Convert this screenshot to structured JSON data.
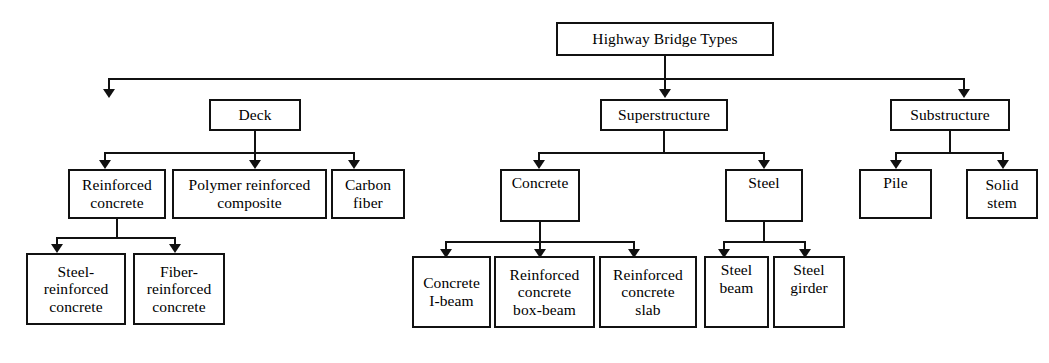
{
  "diagram": {
    "title_node": "Highway Bridge Types",
    "type": "hierarchy-tree",
    "orientation": "top-down",
    "line_color": "#111111",
    "box_fill": "#ffffff",
    "levels": [
      {
        "level": 0,
        "nodes": [
          {
            "id": "root",
            "label": "Highway Bridge Types"
          }
        ]
      },
      {
        "level": 1,
        "nodes": [
          {
            "id": "deck",
            "label": "Deck",
            "parent": "root"
          },
          {
            "id": "superstructure",
            "label": "Superstructure",
            "parent": "root"
          },
          {
            "id": "substructure",
            "label": "Substructure",
            "parent": "root"
          }
        ]
      },
      {
        "level": 2,
        "nodes": [
          {
            "id": "reinforced-concrete",
            "label": "Reinforced\nconcrete",
            "parent": "deck"
          },
          {
            "id": "polymer-reinforced-composite",
            "label": "Polymer reinforced\ncomposite",
            "parent": "deck"
          },
          {
            "id": "carbon-fiber",
            "label": "Carbon\nfiber",
            "parent": "deck"
          },
          {
            "id": "concrete",
            "label": "Concrete",
            "parent": "superstructure"
          },
          {
            "id": "steel",
            "label": "Steel",
            "parent": "superstructure"
          },
          {
            "id": "pile",
            "label": "Pile",
            "parent": "substructure"
          },
          {
            "id": "solid-stem",
            "label": "Solid\nstem",
            "parent": "substructure"
          }
        ]
      },
      {
        "level": 3,
        "nodes": [
          {
            "id": "steel-reinforced-concrete",
            "label": "Steel-\nreinforced\nconcrete",
            "parent": "reinforced-concrete"
          },
          {
            "id": "fiber-reinforced-concrete",
            "label": "Fiber-\nreinforced\nconcrete",
            "parent": "reinforced-concrete"
          },
          {
            "id": "concrete-i-beam",
            "label": "Concrete\nI-beam",
            "parent": "concrete"
          },
          {
            "id": "reinforced-concrete-box-beam",
            "label": "Reinforced\nconcrete\nbox-beam",
            "parent": "concrete"
          },
          {
            "id": "reinforced-concrete-slab",
            "label": "Reinforced\nconcrete\nslab",
            "parent": "concrete"
          },
          {
            "id": "steel-beam",
            "label": "Steel\nbeam",
            "parent": "steel"
          },
          {
            "id": "steel-girder",
            "label": "Steel\ngirder",
            "parent": "steel"
          }
        ]
      }
    ]
  }
}
